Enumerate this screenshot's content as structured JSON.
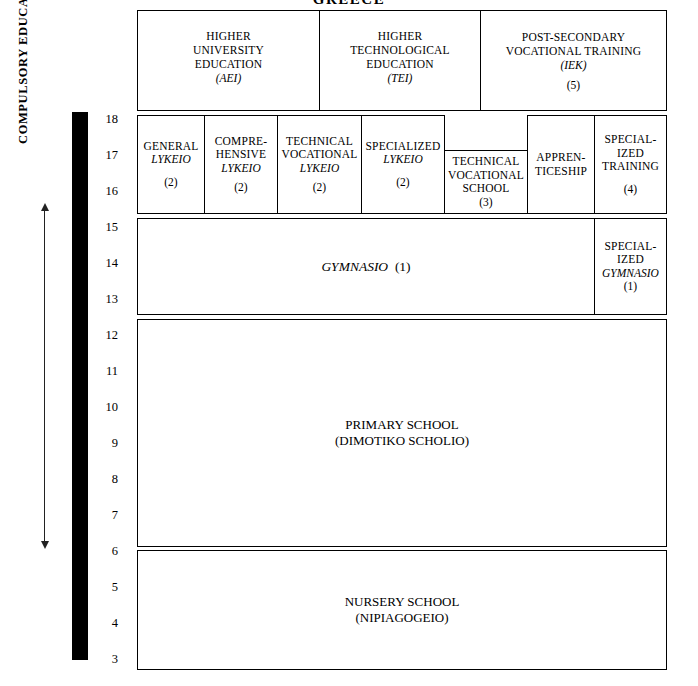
{
  "title": "GREECE",
  "side": {
    "compulsory_label": "COMPULSORY EDUCATION",
    "age_numbers": [
      "18",
      "17",
      "16",
      "15",
      "14",
      "13",
      "12",
      "11",
      "10",
      "9",
      "8",
      "7",
      "6",
      "5",
      "4",
      "3"
    ]
  },
  "levels": {
    "tertiary": [
      {
        "name": "higher-university-education",
        "lines": "HIGHER\nUNIVERSITY\nEDUCATION",
        "abbr": "(AEI)",
        "note": ""
      },
      {
        "name": "higher-technological-education",
        "lines": "HIGHER\nTECHNOLOGICAL\nEDUCATION",
        "abbr": "(TEI)",
        "note": ""
      },
      {
        "name": "post-secondary-vocational-training",
        "lines": "POST-SECONDARY\nVOCATIONAL TRAINING",
        "abbr": "(IEK)",
        "note": "(5)"
      }
    ],
    "upper_secondary": [
      {
        "name": "general-lykeio",
        "lines": "GENERAL",
        "ital": "LYKEIO",
        "note": "(2)"
      },
      {
        "name": "comprehensive-lykeio",
        "lines": "COMPRE-\nHENSIVE",
        "ital": "LYKEIO",
        "note": "(2)"
      },
      {
        "name": "technical-vocational-lykeio",
        "lines": "TECHNICAL\nVOCATIONAL",
        "ital": "LYKEIO",
        "note": "(2)"
      },
      {
        "name": "specialized-lykeio",
        "lines": "SPECIALIZED",
        "ital": "LYKEIO",
        "note": "(2)"
      },
      {
        "name": "technical-vocational-school",
        "lines": "TECHNICAL\nVOCATIONAL\nSCHOOL",
        "ital": "",
        "note": "(3)"
      },
      {
        "name": "apprenticeship",
        "lines": "APPREN-\nTICESHIP",
        "ital": "",
        "note": ""
      },
      {
        "name": "specialized-training",
        "lines": "SPECIAL-\nIZED\nTRAINING",
        "ital": "",
        "note": "(4)"
      }
    ],
    "lower_secondary": [
      {
        "name": "gymnasio",
        "ital": "GYMNASIO",
        "note": "(1)"
      },
      {
        "name": "specialized-gymnasio",
        "lines": "SPECIAL-\nIZED",
        "ital": "GYMNASIO",
        "note": "(1)"
      }
    ],
    "primary": {
      "name": "primary-school",
      "title": "PRIMARY  SCHOOL",
      "subtitle": "(DIMOTIKO SCHOLIO)"
    },
    "preprimary": {
      "name": "nursery-school",
      "title": "NURSERY SCHOOL",
      "subtitle": "(NIPIAGOGEIO)"
    }
  }
}
